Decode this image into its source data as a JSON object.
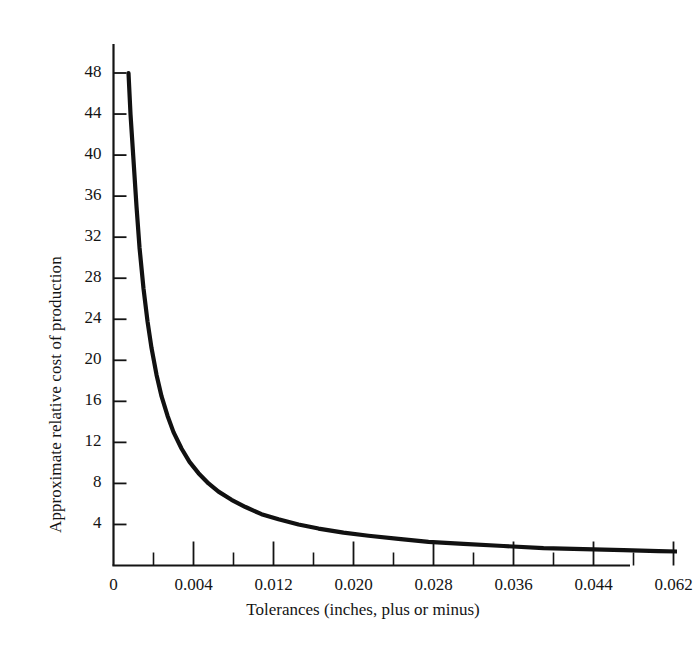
{
  "chart_data": {
    "type": "line",
    "title": "",
    "xlabel": "Tolerances (inches, plus or minus)",
    "ylabel": "Approximate relative cost of production",
    "xlim": [
      0,
      0.062
    ],
    "ylim": [
      0,
      50
    ],
    "grid": false,
    "legend": null,
    "x_tick_labels": [
      "0",
      "0.004",
      "0.012",
      "0.020",
      "0.028",
      "0.036",
      "0.044",
      "0.062"
    ],
    "x_tick_values": [
      0,
      0.004,
      0.012,
      0.02,
      0.028,
      0.036,
      0.044,
      0.062
    ],
    "x_minor_ticks": [
      0.008,
      0.016,
      0.024,
      0.032,
      0.04,
      0.048,
      0.056
    ],
    "y_tick_labels": [
      "4",
      "8",
      "12",
      "16",
      "20",
      "24",
      "28",
      "32",
      "36",
      "40",
      "44",
      "48"
    ],
    "y_tick_values": [
      4,
      8,
      12,
      16,
      20,
      24,
      28,
      32,
      36,
      40,
      44,
      48
    ],
    "series": [
      {
        "name": "Approximate relative cost of production",
        "color": "#111111",
        "x": [
          0.0015,
          0.0017,
          0.002,
          0.0023,
          0.0026,
          0.003,
          0.0034,
          0.0038,
          0.0043,
          0.0048,
          0.0054,
          0.006,
          0.0068,
          0.0076,
          0.0085,
          0.0095,
          0.0105,
          0.0118,
          0.0132,
          0.0148,
          0.0165,
          0.0185,
          0.0205,
          0.023,
          0.0255,
          0.0285,
          0.0315,
          0.035,
          0.039,
          0.043,
          0.047,
          0.051,
          0.0545,
          0.057
        ],
        "y": [
          48.0,
          44.0,
          39.5,
          35.0,
          31.0,
          27.0,
          23.8,
          21.2,
          18.6,
          16.5,
          14.6,
          13.0,
          11.4,
          10.1,
          9.0,
          8.0,
          7.2,
          6.4,
          5.7,
          5.0,
          4.5,
          4.0,
          3.6,
          3.2,
          2.9,
          2.6,
          2.3,
          2.1,
          1.9,
          1.7,
          1.6,
          1.5,
          1.4,
          1.35
        ]
      }
    ]
  },
  "axes": {
    "x_axis_name": "tolerances-axis",
    "y_axis_name": "cost-axis"
  }
}
